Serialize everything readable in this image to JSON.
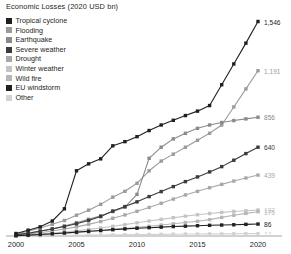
{
  "chart_data": {
    "type": "line",
    "title": "Economic Losses (2020 USD bn)",
    "xlabel": "",
    "ylabel": "",
    "grid": false,
    "legend_position": "top-left",
    "x": [
      2000,
      2001,
      2002,
      2003,
      2004,
      2005,
      2006,
      2007,
      2008,
      2009,
      2010,
      2011,
      2012,
      2013,
      2014,
      2015,
      2016,
      2017,
      2018,
      2019,
      2020
    ],
    "xlim": [
      2000,
      2020
    ],
    "ylim": [
      0,
      1600
    ],
    "xticks": [
      "2000",
      "2005",
      "2010",
      "2015",
      "2020"
    ],
    "xtick_values": [
      2000,
      2005,
      2010,
      2015,
      2020
    ],
    "series": [
      {
        "name": "Tropical cyclone",
        "color": "#231f20",
        "end_value": 1546,
        "end_label": "1,546",
        "values": [
          18,
          42,
          66,
          108,
          196,
          470,
          520,
          556,
          650,
          680,
          716,
          760,
          800,
          834,
          868,
          900,
          940,
          1090,
          1240,
          1390,
          1546
        ]
      },
      {
        "name": "Flooding",
        "color": "#9b9b9b",
        "end_value": 1191,
        "end_label": "1,191",
        "values": [
          14,
          34,
          58,
          84,
          112,
          150,
          186,
          228,
          280,
          322,
          380,
          470,
          540,
          590,
          640,
          690,
          740,
          800,
          930,
          1060,
          1191
        ]
      },
      {
        "name": "Earthquake",
        "color": "#8a8a8a",
        "end_value": 856,
        "end_label": "856",
        "values": [
          10,
          22,
          36,
          52,
          72,
          96,
          120,
          146,
          176,
          208,
          300,
          560,
          640,
          700,
          740,
          776,
          800,
          818,
          832,
          844,
          856
        ]
      },
      {
        "name": "Severe weather",
        "color": "#3c3a3b",
        "end_value": 640,
        "end_label": "640",
        "values": [
          8,
          20,
          34,
          50,
          68,
          88,
          112,
          140,
          180,
          212,
          246,
          284,
          320,
          356,
          392,
          426,
          462,
          500,
          546,
          594,
          640
        ]
      },
      {
        "name": "Drought",
        "color": "#a8a8a8",
        "end_value": 439,
        "end_label": "439",
        "values": [
          6,
          14,
          24,
          36,
          50,
          66,
          84,
          104,
          128,
          152,
          178,
          206,
          236,
          266,
          296,
          322,
          348,
          372,
          396,
          418,
          439
        ]
      },
      {
        "name": "Winter weather",
        "color": "#c4c4c4",
        "end_value": 187,
        "end_label": "187",
        "values": [
          3,
          8,
          14,
          21,
          29,
          38,
          48,
          58,
          70,
          82,
          95,
          108,
          120,
          132,
          143,
          153,
          162,
          170,
          177,
          182,
          187
        ]
      },
      {
        "name": "Wild fire",
        "color": "#b6b6b6",
        "end_value": 175,
        "end_label": "175",
        "values": [
          2,
          5,
          9,
          14,
          19,
          25,
          31,
          38,
          46,
          54,
          62,
          70,
          79,
          88,
          97,
          106,
          118,
          134,
          150,
          163,
          175
        ]
      },
      {
        "name": "EU windstorm",
        "color": "#231f20",
        "end_value": 86,
        "end_label": "86",
        "values": [
          2,
          6,
          11,
          16,
          22,
          28,
          34,
          40,
          46,
          51,
          56,
          60,
          64,
          68,
          71,
          74,
          77,
          79,
          81,
          84,
          86
        ]
      },
      {
        "name": "Other",
        "color": "#d2d2d2",
        "end_value": 17,
        "end_label": "17",
        "values": [
          0,
          1,
          2,
          3,
          4,
          5,
          6,
          7,
          8,
          9,
          10,
          11,
          12,
          13,
          14,
          14,
          15,
          15,
          16,
          17,
          17
        ]
      }
    ]
  },
  "legend": {
    "items": [
      {
        "label": "Tropical cyclone",
        "color": "#231f20"
      },
      {
        "label": "Flooding",
        "color": "#9b9b9b"
      },
      {
        "label": "Earthquake",
        "color": "#8a8a8a"
      },
      {
        "label": "Severe weather",
        "color": "#3c3a3b"
      },
      {
        "label": "Drought",
        "color": "#a8a8a8"
      },
      {
        "label": "Winter weather",
        "color": "#c4c4c4"
      },
      {
        "label": "Wild fire",
        "color": "#b6b6b6"
      },
      {
        "label": "EU windstorm",
        "color": "#231f20"
      },
      {
        "label": "Other",
        "color": "#d2d2d2"
      }
    ]
  },
  "axis": {
    "line_color": "#8e8e8e"
  }
}
